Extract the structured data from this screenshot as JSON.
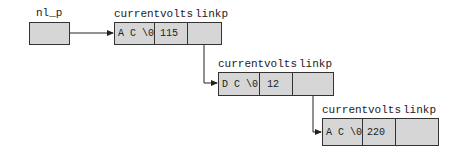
{
  "pointer": {
    "label": "nl_p"
  },
  "field_headers": {
    "current": "current",
    "volts": "volts",
    "linkp": "linkp"
  },
  "nodes": [
    {
      "current": "A C \\0",
      "volts": "115",
      "linkp": "pointer"
    },
    {
      "current": "D C \\0",
      "volts": "12",
      "linkp": "pointer"
    },
    {
      "current": "A C \\0",
      "volts": "220",
      "linkp": "NULL"
    }
  ],
  "colors": {
    "cell_fill": "#d6d6d6",
    "stroke": "#333333"
  }
}
